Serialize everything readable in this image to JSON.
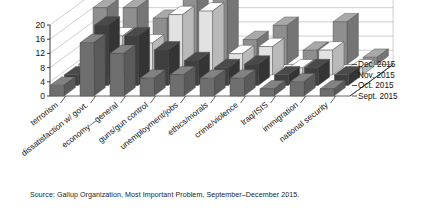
{
  "figure": {
    "source_note": "Source: Gallup Organization, Most Important Problem, September–December 2015."
  },
  "chart_data": {
    "type": "bar",
    "title": "",
    "subtitle": "",
    "xlabel": "",
    "ylabel": "",
    "ylim": [
      0,
      20
    ],
    "yticks": [
      "0",
      "4",
      "8",
      "12",
      "16",
      "20"
    ],
    "grid": true,
    "projection": "3d",
    "legend_position": "right",
    "categories": [
      "terrorism",
      "dissatisfaction w/ govt.",
      "economy—general",
      "guns/gun control",
      "unemployment/jobs",
      "ethics/morals",
      "crime/violence",
      "Iraq/ISIS",
      "immigration",
      "national security"
    ],
    "series": [
      {
        "name": "Dec. 2015",
        "color": "#8f8f8f",
        "values": [
          16,
          16,
          13,
          20,
          19,
          7,
          11,
          4,
          12,
          2
        ]
      },
      {
        "name": "Nov. 2015",
        "color": "#e2e2e2",
        "values": [
          3,
          11,
          9,
          17,
          18,
          6,
          8,
          2,
          7,
          2
        ]
      },
      {
        "name": "Oct. 2015",
        "color": "#3f3f3f",
        "values": [
          3,
          17,
          14,
          10,
          7,
          5,
          6,
          3,
          5,
          3
        ]
      },
      {
        "name": "Sept. 2015",
        "color": "#6e6e6e",
        "values": [
          3,
          15,
          12,
          5,
          6,
          5,
          5,
          2,
          4,
          2
        ]
      }
    ]
  },
  "legend": {
    "items": [
      {
        "label": "Dec. 2015"
      },
      {
        "label": "Nov. 2015"
      },
      {
        "label": "Oct. 2015"
      },
      {
        "label": "Sept. 2015"
      }
    ]
  },
  "colors": {
    "axis": "#3a3a3a",
    "grid": "#b9b9b9",
    "floor": "#ffffff",
    "text": "#111111"
  }
}
